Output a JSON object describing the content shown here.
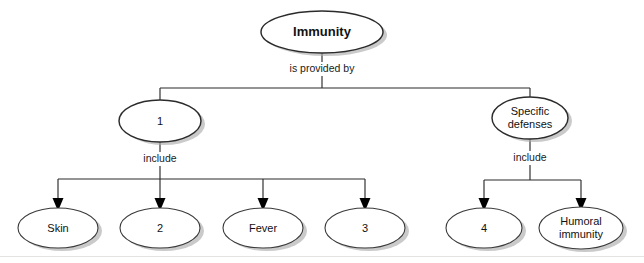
{
  "diagram": {
    "title_fragment": "",
    "root": {
      "label": "Immunity",
      "cx": 322,
      "cy": 32
    },
    "link_labels": {
      "is_provided_by": "is provided by",
      "include_left": "include",
      "include_right": "include"
    },
    "level2": [
      {
        "label": "1",
        "cx": 160,
        "cy": 121,
        "rx": 41,
        "ry": 21,
        "heavy": true
      },
      {
        "label_line1": "Specific",
        "label_line2": "defenses",
        "cx": 530,
        "cy": 118,
        "rx": 38,
        "ry": 21,
        "heavy": true
      }
    ],
    "level3_left": [
      {
        "label": "Skin",
        "cx": 58,
        "cy": 228,
        "rx": 40,
        "ry": 20
      },
      {
        "label": "2",
        "cx": 160,
        "cy": 228,
        "rx": 40,
        "ry": 20
      },
      {
        "label": "Fever",
        "cx": 263,
        "cy": 228,
        "rx": 40,
        "ry": 20
      },
      {
        "label": "3",
        "cx": 365,
        "cy": 228,
        "rx": 40,
        "ry": 20
      }
    ],
    "level3_right": [
      {
        "label": "4",
        "cx": 484,
        "cy": 228,
        "rx": 38,
        "ry": 20
      },
      {
        "label_line1": "Humoral",
        "label_line2": "immunity",
        "cx": 581,
        "cy": 228,
        "rx": 42,
        "ry": 21
      }
    ],
    "colors": {
      "stroke": "#2b2b2b",
      "shadow": "#a9a9a9",
      "fill": "#ffffff",
      "text": "#111111"
    }
  }
}
